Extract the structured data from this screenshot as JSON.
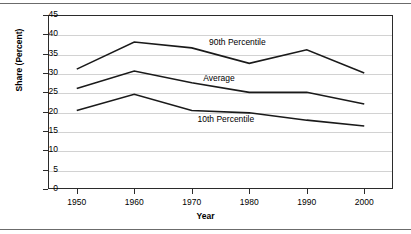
{
  "chart_data": {
    "type": "line",
    "title": "",
    "xlabel": "Year",
    "ylabel": "Share (Percent)",
    "x": [
      1950,
      1960,
      1970,
      1980,
      1990,
      2000
    ],
    "categories": [
      "1950",
      "1960",
      "1970",
      "1980",
      "1990",
      "2000"
    ],
    "xlim": [
      1945,
      2005
    ],
    "ylim": [
      0,
      45
    ],
    "yticks": [
      0,
      5,
      10,
      15,
      20,
      25,
      30,
      35,
      40,
      45
    ],
    "ytick_labels": [
      "0",
      "5",
      "10",
      "15",
      "20",
      "25",
      "30",
      "35",
      "40",
      "45"
    ],
    "xtick_labels": [
      "1950",
      "1960",
      "1970",
      "1980",
      "1990",
      "2000"
    ],
    "grid": "horizontal",
    "legend_position": "inline-annotations",
    "series": [
      {
        "name": "90th Percentile",
        "values": [
          31.0,
          38.0,
          36.5,
          32.5,
          36.0,
          30.0
        ],
        "color": "#1a1a1a"
      },
      {
        "name": "Average",
        "values": [
          26.0,
          30.5,
          27.5,
          25.0,
          25.0,
          22.0
        ],
        "color": "#1a1a1a"
      },
      {
        "name": "10th Percentile",
        "values": [
          20.3,
          24.5,
          20.3,
          19.7,
          17.8,
          16.3
        ],
        "color": "#1a1a1a"
      }
    ],
    "annotations": [
      {
        "text": "90th Percentile",
        "x": 1973,
        "y": 38.0
      },
      {
        "text": "Average",
        "x": 1972,
        "y": 28.8
      },
      {
        "text": "10th Percentile",
        "x": 1971,
        "y": 18.2
      }
    ]
  },
  "colors": {
    "line": "#1a1a1a",
    "grid": "#d2d2d2",
    "frame": "#2b2b2b",
    "rule": "#6b6b6b",
    "background": "#ffffff"
  }
}
